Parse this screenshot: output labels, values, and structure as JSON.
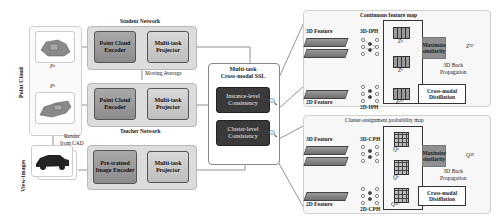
{
  "left": {
    "point_cloud_label": "Point Cloud",
    "view_images_label": "View-images",
    "pc_a_symbol": "Pᵃ",
    "pc_b_symbol": "Pᵇ",
    "render_label_line1": "Render",
    "render_label_line2": "from CAD"
  },
  "student": {
    "title": "Student Network",
    "encoder": "Point Cloud Encoder",
    "projector": "Multi-task Projector"
  },
  "moving_average": "Moving Average",
  "teacher": {
    "title": "Teacher Network",
    "encoder": "Point Cloud Encoder",
    "projector": "Multi-task Projector"
  },
  "image_branch": {
    "encoder": "Pre-trained Image Encoder",
    "projector": "Multi-task Projector"
  },
  "ssl": {
    "title_line1": "Multi-task",
    "title_line2": "Cross-modal SSL",
    "instance": "Instance-level Consistency",
    "cluster": "Cluster-level Consistency"
  },
  "continuous": {
    "title": "Continuous feature map",
    "feature_3d": "3D Feature",
    "feature_2d": "2D Feature",
    "head_3d": "3D-IPH",
    "head_2d": "2D-IPH",
    "z_a": "Zᵃ",
    "z_b": "Zᵇ",
    "z_2d": "Z²ᴰ",
    "z_3d": "Z³ᴰ",
    "maximize": "Maximize similarity",
    "backprop_line1": "3D Back",
    "backprop_line2": "Propagation",
    "distill": "Cross-modal Distillation"
  },
  "cluster_map": {
    "title": "Cluster-assignment probability map",
    "feature_3d": "3D Feature",
    "feature_2d": "2D Feature",
    "head_3d": "3D-CPH",
    "head_2d": "2D-CPH",
    "q_a": "Qᵃ",
    "q_b": "Qᵇ",
    "q_2d": "Q²ᴰ",
    "q_3d": "Q³ᴰ",
    "maximize": "Maximize similarity",
    "backprop_line1": "3D Back",
    "backprop_line2": "Propagation",
    "distill": "Cross-modal Distillation"
  },
  "colors": {
    "module_dark": "#9a9a9a",
    "module_light": "#c8c8c8",
    "consistency_box": "#3a3a3a",
    "panel_bg": "#f7f7f7"
  }
}
